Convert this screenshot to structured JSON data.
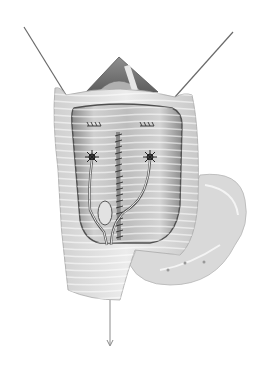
{
  "image": {
    "type": "grayscale surgical illustration",
    "subject": "opened organ with retracted edges, sutured midline incision and two stented tubes",
    "background": "#ffffff",
    "tones": {
      "dark": "#3a3a3a",
      "mid": "#9a9a9a",
      "light": "#d8d8d8",
      "highlight": "#f2f2f2"
    },
    "elements": [
      {
        "name": "retraction-suture-left"
      },
      {
        "name": "retraction-suture-right"
      },
      {
        "name": "dome-opening"
      },
      {
        "name": "organ-wall"
      },
      {
        "name": "inner-lumen"
      },
      {
        "name": "midline-suture-line"
      },
      {
        "name": "stent-left"
      },
      {
        "name": "stent-right"
      },
      {
        "name": "bowel-segment"
      },
      {
        "name": "drain-arrow"
      }
    ]
  }
}
